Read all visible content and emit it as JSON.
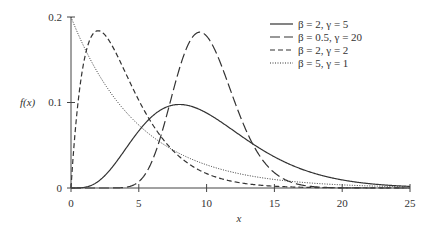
{
  "chart_data": {
    "type": "line",
    "title": "",
    "xlabel": "x",
    "ylabel": "f(x)",
    "xlim": [
      0,
      25
    ],
    "ylim": [
      0,
      0.2
    ],
    "x_ticks": [
      "0",
      "5",
      "10",
      "15",
      "20",
      "25"
    ],
    "y_ticks": [
      "0",
      "0.1",
      "0.2"
    ],
    "grid": false,
    "legend_position": "upper right",
    "distribution": "gamma pdf: f(x) = x^(γ-1) e^(-x/β) / (β^γ Γ(γ))",
    "series": [
      {
        "name": "β = 2, γ = 5",
        "beta": 2,
        "gamma": 5,
        "style": "solid",
        "peak": {
          "x": 8,
          "y": 0.098
        }
      },
      {
        "name": "β = 0.5, γ = 20",
        "beta": 0.5,
        "gamma": 20,
        "style": "long-dash",
        "peak": {
          "x": 9.5,
          "y": 0.182
        }
      },
      {
        "name": "β = 2, γ = 2",
        "beta": 2,
        "gamma": 2,
        "style": "short-dash",
        "peak": {
          "x": 2,
          "y": 0.184
        }
      },
      {
        "name": "β = 5, γ = 1",
        "beta": 5,
        "gamma": 1,
        "style": "dotted",
        "peak": {
          "x": 0,
          "y": 0.2
        }
      }
    ]
  },
  "labels": {
    "xlabel": "x",
    "ylabel": "f(x)",
    "xticks": [
      "0",
      "5",
      "10",
      "15",
      "20",
      "25"
    ],
    "yticks": [
      "0",
      "0.1",
      "0.2"
    ],
    "legend": [
      "β = 2, γ = 5",
      "β = 0.5, γ = 20",
      "β = 2, γ = 2",
      "β = 5, γ = 1"
    ]
  }
}
